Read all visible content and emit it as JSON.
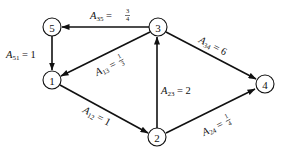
{
  "diagram": {
    "type": "directed-graph",
    "nodes": [
      {
        "id": "1",
        "label": "1"
      },
      {
        "id": "2",
        "label": "2"
      },
      {
        "id": "3",
        "label": "3"
      },
      {
        "id": "4",
        "label": "4"
      },
      {
        "id": "5",
        "label": "5"
      }
    ],
    "edges": [
      {
        "from": "3",
        "to": "5",
        "var": "A",
        "sub": "35",
        "eq": " = ",
        "value": "3/4",
        "num": "3",
        "den": "4"
      },
      {
        "from": "5",
        "to": "1",
        "var": "A",
        "sub": "51",
        "eq": " = ",
        "value": "1"
      },
      {
        "from": "3",
        "to": "1",
        "var": "A",
        "sub": "13",
        "eq": " = ",
        "value": "1/3",
        "num": "1",
        "den": "3"
      },
      {
        "from": "1",
        "to": "2",
        "var": "A",
        "sub": "12",
        "eq": " = ",
        "value": "1"
      },
      {
        "from": "2",
        "to": "3",
        "var": "A",
        "sub": "23",
        "eq": " = ",
        "value": "2"
      },
      {
        "from": "3",
        "to": "4",
        "var": "A",
        "sub": "34",
        "eq": " = ",
        "value": "6"
      },
      {
        "from": "2",
        "to": "4",
        "var": "A",
        "sub": "24",
        "eq": " = ",
        "value": "1/4",
        "num": "1",
        "den": "4"
      }
    ]
  }
}
